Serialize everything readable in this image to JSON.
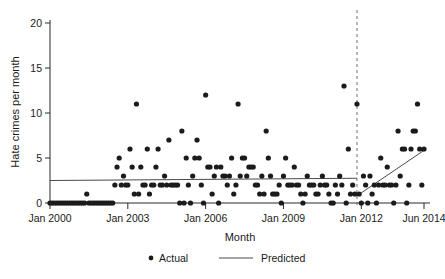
{
  "chart_data": {
    "type": "scatter",
    "title": "",
    "xlabel": "Month",
    "ylabel": "Hate crimes per month",
    "ylim": [
      0,
      20
    ],
    "yticks": [
      0,
      5,
      10,
      15,
      20
    ],
    "ytick_labels": [
      "0",
      "5",
      "10",
      "15",
      "20"
    ],
    "xlim": [
      "Jan 2000",
      "Jun 2014"
    ],
    "xticks": [
      0,
      36,
      72,
      108,
      144,
      173
    ],
    "xtick_labels": [
      "Jan 2000",
      "Jan 2003",
      "Jan 2006",
      "Jan 2009",
      "Jan 2012",
      "Jun 2014"
    ],
    "grid": false,
    "legend_position": "bottom-center",
    "legend": [
      {
        "label": "Actual",
        "marker": "dot",
        "color": "#1b1b1b"
      },
      {
        "label": "Predicted",
        "marker": "line",
        "color": "#4a4a4a"
      }
    ],
    "annotations": [
      {
        "name": "intervention-line",
        "type": "vertical-dashed-line",
        "x_month_index": 142,
        "x_label": "Nov 2011"
      }
    ],
    "series": [
      {
        "name": "Actual",
        "type": "scatter",
        "x_unit": "months since Jan 2000",
        "points": [
          [
            0,
            0
          ],
          [
            1,
            0
          ],
          [
            2,
            0
          ],
          [
            3,
            0
          ],
          [
            4,
            0
          ],
          [
            5,
            0
          ],
          [
            6,
            0
          ],
          [
            7,
            0
          ],
          [
            8,
            0
          ],
          [
            9,
            0
          ],
          [
            10,
            0
          ],
          [
            11,
            0
          ],
          [
            12,
            0
          ],
          [
            13,
            0
          ],
          [
            14,
            0
          ],
          [
            15,
            0
          ],
          [
            16,
            0
          ],
          [
            17,
            1
          ],
          [
            18,
            0
          ],
          [
            19,
            0
          ],
          [
            20,
            0
          ],
          [
            21,
            0
          ],
          [
            22,
            0
          ],
          [
            23,
            0
          ],
          [
            24,
            0
          ],
          [
            25,
            0
          ],
          [
            26,
            0
          ],
          [
            27,
            0
          ],
          [
            28,
            0
          ],
          [
            29,
            0
          ],
          [
            30,
            2
          ],
          [
            31,
            4
          ],
          [
            32,
            5
          ],
          [
            33,
            2
          ],
          [
            34,
            3
          ],
          [
            35,
            2
          ],
          [
            36,
            2
          ],
          [
            37,
            6
          ],
          [
            38,
            4
          ],
          [
            39,
            1
          ],
          [
            40,
            11
          ],
          [
            41,
            1
          ],
          [
            42,
            4
          ],
          [
            43,
            2
          ],
          [
            44,
            2
          ],
          [
            45,
            6
          ],
          [
            46,
            1
          ],
          [
            47,
            2
          ],
          [
            48,
            2
          ],
          [
            49,
            4
          ],
          [
            50,
            6
          ],
          [
            51,
            2
          ],
          [
            52,
            2
          ],
          [
            53,
            3
          ],
          [
            54,
            2
          ],
          [
            55,
            7
          ],
          [
            56,
            2
          ],
          [
            57,
            2
          ],
          [
            58,
            2
          ],
          [
            59,
            2
          ],
          [
            60,
            0
          ],
          [
            61,
            8
          ],
          [
            62,
            0
          ],
          [
            63,
            5
          ],
          [
            64,
            2
          ],
          [
            65,
            0
          ],
          [
            66,
            3
          ],
          [
            67,
            5
          ],
          [
            68,
            7
          ],
          [
            69,
            5
          ],
          [
            70,
            2
          ],
          [
            71,
            0
          ],
          [
            72,
            12
          ],
          [
            73,
            4
          ],
          [
            74,
            4
          ],
          [
            75,
            1
          ],
          [
            76,
            3
          ],
          [
            77,
            4
          ],
          [
            78,
            0
          ],
          [
            79,
            4
          ],
          [
            80,
            3
          ],
          [
            81,
            3
          ],
          [
            82,
            2
          ],
          [
            83,
            3
          ],
          [
            84,
            5
          ],
          [
            85,
            1
          ],
          [
            86,
            2
          ],
          [
            87,
            11
          ],
          [
            88,
            3
          ],
          [
            89,
            5
          ],
          [
            90,
            5
          ],
          [
            91,
            3
          ],
          [
            92,
            4
          ],
          [
            93,
            4
          ],
          [
            94,
            4
          ],
          [
            95,
            2
          ],
          [
            96,
            2
          ],
          [
            97,
            1
          ],
          [
            98,
            3
          ],
          [
            99,
            1
          ],
          [
            100,
            8
          ],
          [
            101,
            5
          ],
          [
            102,
            3
          ],
          [
            103,
            1
          ],
          [
            104,
            1
          ],
          [
            105,
            1
          ],
          [
            106,
            2
          ],
          [
            107,
            0
          ],
          [
            108,
            3
          ],
          [
            109,
            5
          ],
          [
            110,
            2
          ],
          [
            111,
            2
          ],
          [
            112,
            2
          ],
          [
            113,
            4
          ],
          [
            114,
            2
          ],
          [
            115,
            2
          ],
          [
            116,
            1
          ],
          [
            117,
            0
          ],
          [
            118,
            1
          ],
          [
            119,
            3
          ],
          [
            120,
            2
          ],
          [
            121,
            2
          ],
          [
            122,
            2
          ],
          [
            123,
            1
          ],
          [
            124,
            1
          ],
          [
            125,
            2
          ],
          [
            126,
            3
          ],
          [
            127,
            2
          ],
          [
            128,
            2
          ],
          [
            129,
            1
          ],
          [
            130,
            0
          ],
          [
            131,
            0
          ],
          [
            132,
            2
          ],
          [
            133,
            1
          ],
          [
            134,
            3
          ],
          [
            135,
            2
          ],
          [
            136,
            13
          ],
          [
            137,
            0
          ],
          [
            138,
            6
          ],
          [
            139,
            1
          ],
          [
            140,
            2
          ],
          [
            141,
            1
          ],
          [
            142,
            11
          ],
          [
            143,
            1
          ],
          [
            144,
            0
          ],
          [
            145,
            3
          ],
          [
            146,
            2
          ],
          [
            147,
            0
          ],
          [
            148,
            3
          ],
          [
            149,
            1
          ],
          [
            150,
            2
          ],
          [
            151,
            0
          ],
          [
            152,
            2
          ],
          [
            153,
            5
          ],
          [
            154,
            2
          ],
          [
            155,
            2
          ],
          [
            156,
            4
          ],
          [
            157,
            2
          ],
          [
            158,
            2
          ],
          [
            159,
            0
          ],
          [
            160,
            2
          ],
          [
            161,
            8
          ],
          [
            162,
            3
          ],
          [
            163,
            6
          ],
          [
            164,
            6
          ],
          [
            165,
            0
          ],
          [
            166,
            2
          ],
          [
            167,
            6
          ],
          [
            168,
            8
          ],
          [
            169,
            8
          ],
          [
            170,
            11
          ],
          [
            171,
            6
          ],
          [
            172,
            2
          ],
          [
            173,
            6
          ]
        ]
      },
      {
        "name": "Predicted",
        "type": "line",
        "segments": [
          {
            "name": "pre-intervention",
            "x_start": 0,
            "y_start": 2.5,
            "x_end": 142,
            "y_end": 2.75
          },
          {
            "name": "post-intervention",
            "x_start": 142,
            "y_start": 0.8,
            "x_end": 173,
            "y_end": 5.85
          }
        ]
      }
    ]
  },
  "axes": {
    "y_label": "Hate crimes per month",
    "x_label": "Month"
  }
}
